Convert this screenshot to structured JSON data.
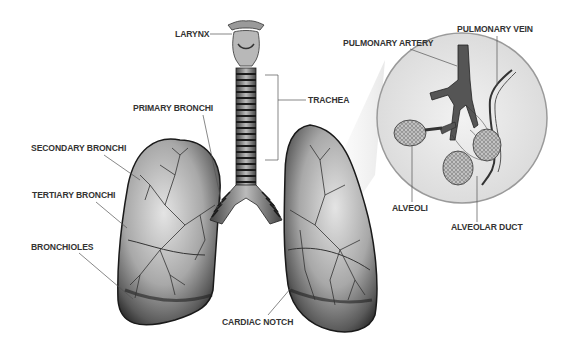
{
  "diagram": {
    "type": "anatomical-illustration",
    "style": "grayscale",
    "colors": {
      "background": "#ffffff",
      "label_text": "#333333",
      "leader_line": "#555555",
      "lung_dark": "#2a2a2a",
      "lung_mid": "#8a8a8a",
      "lung_light": "#d8d8d8",
      "inset_circle_fill": "#e6e6e6",
      "inset_circle_border": "#999999"
    },
    "labels": {
      "larynx": "LARYNX",
      "trachea": "TRACHEA",
      "primary_bronchi": "PRIMARY BRONCHI",
      "secondary_bronchi": "SECONDARY BRONCHI",
      "tertiary_bronchi": "TERTIARY BRONCHI",
      "bronchioles": "BRONCHIOLES",
      "cardiac_notch": "CARDIAC NOTCH",
      "pulmonary_artery": "PULMONARY ARTERY",
      "pulmonary_vein": "PULMONARY VEIN",
      "alveoli": "ALVEOLI",
      "alveolar_duct": "ALVEOLAR DUCT"
    },
    "inset": {
      "shape": "circle",
      "content": "magnified alveoli cluster with blood vessels"
    }
  }
}
